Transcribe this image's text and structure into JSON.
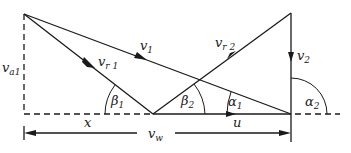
{
  "diagram": {
    "type": "velocity-triangle",
    "labels": {
      "v1": {
        "main": "v",
        "sub": "1"
      },
      "vr1": {
        "main": "v",
        "sub": "r 1"
      },
      "va1": {
        "main": "v",
        "sub": "a1"
      },
      "vr2": {
        "main": "v",
        "sub": "r 2"
      },
      "v2": {
        "main": "v",
        "sub": "2"
      },
      "vw": {
        "main": "v",
        "sub": "w"
      },
      "beta1": {
        "main": "β",
        "sub": "1"
      },
      "beta2": {
        "main": "β",
        "sub": "2"
      },
      "alpha1": {
        "main": "α",
        "sub": "1"
      },
      "alpha2": {
        "main": "α",
        "sub": "2"
      },
      "x": {
        "main": "x"
      },
      "u": {
        "main": "u"
      }
    },
    "colors": {
      "stroke": "#1a1a1a",
      "background": "#ffffff"
    }
  }
}
